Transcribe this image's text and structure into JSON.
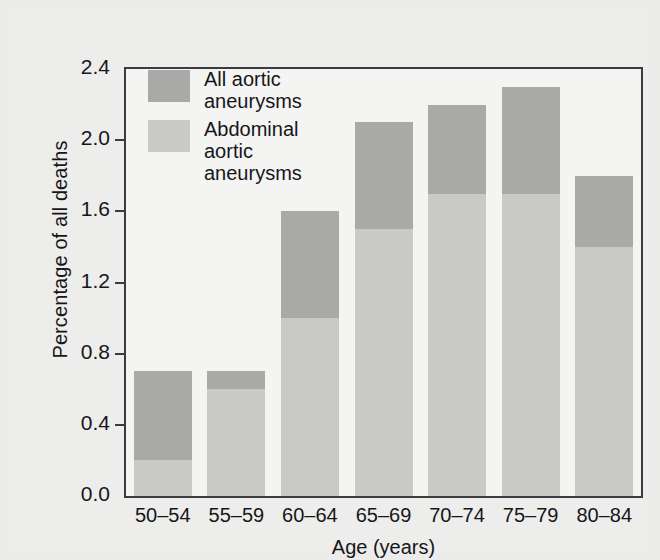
{
  "chart_data": {
    "type": "bar",
    "subtype": "stacked-overlay",
    "title": "",
    "xlabel": "Age (years)",
    "ylabel": "Percentage of all deaths",
    "categories": [
      "50–54",
      "55–59",
      "60–64",
      "65–69",
      "70–74",
      "75–79",
      "80–84"
    ],
    "series": [
      {
        "name": "All aortic aneurysms",
        "color": "#a9a9a8",
        "values": [
          0.7,
          0.7,
          1.6,
          2.1,
          2.2,
          2.3,
          1.8
        ]
      },
      {
        "name": "Abdominal aortic aneurysms",
        "color": "#c9c9c7",
        "values": [
          0.2,
          0.6,
          1.0,
          1.5,
          1.7,
          1.7,
          1.4
        ]
      }
    ],
    "ylim": [
      0.0,
      2.4
    ],
    "yticks": [
      0.0,
      0.4,
      0.8,
      1.2,
      1.6,
      2.0,
      2.4
    ],
    "ytick_labels": [
      "0.0",
      "0.4",
      "0.8",
      "1.2",
      "1.6",
      "2.0",
      "2.4"
    ],
    "grid": false,
    "legend_position": "top-left",
    "legend": [
      {
        "label_line1": "All aortic",
        "label_line2": "aneurysms",
        "label_line3": "",
        "color": "#a9a9a8"
      },
      {
        "label_line1": "Abdominal",
        "label_line2": "aortic",
        "label_line3": "aneurysms",
        "color": "#c9c9c7"
      }
    ]
  },
  "figure": {
    "background": "#ededec",
    "plot_background": "#f4f4f3",
    "axis_color": "#3b3b40",
    "text_color": "#16161a"
  }
}
